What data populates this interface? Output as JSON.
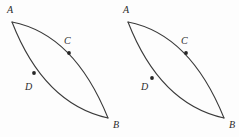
{
  "figure": {
    "type": "geometry-diagram",
    "background_color": "#fdfdfd",
    "stroke_color": "#3a3a3a",
    "label_color": "#2b2b2b",
    "dot_color": "#262626"
  },
  "shapes": [
    {
      "id": "left-figure",
      "name": "left-lens",
      "vertices": [
        {
          "label": "A",
          "x": 12,
          "y": 22,
          "label_x": 7,
          "label_y": 13
        },
        {
          "label": "B",
          "x": 108,
          "y": 118,
          "label_x": 113,
          "label_y": 128
        }
      ],
      "arcs": [
        {
          "id": "upper-arc",
          "name": "arc-A-C-B",
          "path": "M 12 22 Q 74 34 108 118",
          "marked_point": {
            "label": "C",
            "x": 69,
            "y": 53,
            "label_x": 64,
            "label_y": 44
          }
        },
        {
          "id": "lower-arc",
          "name": "arc-A-D-B",
          "path": "M 12 22 Q 44 104 108 118",
          "marked_point": {
            "label": "D",
            "x": 34,
            "y": 73,
            "label_x": 25,
            "label_y": 90
          }
        }
      ]
    },
    {
      "id": "right-figure",
      "name": "right-lens",
      "vertices": [
        {
          "label": "A",
          "x": 128,
          "y": 22,
          "label_x": 123,
          "label_y": 13
        },
        {
          "label": "B",
          "x": 224,
          "y": 118,
          "label_x": 229,
          "label_y": 128
        }
      ],
      "arcs": [
        {
          "id": "upper-arc",
          "name": "arc-A-C-B",
          "path": "M 128 22 Q 190 34 224 118",
          "marked_point": {
            "label": "C",
            "x": 186,
            "y": 53,
            "label_x": 181,
            "label_y": 44
          }
        },
        {
          "id": "lower-arc",
          "name": "arc-A-D-B",
          "path": "M 128 22 Q 160 104 224 118",
          "marked_point": {
            "label": "D",
            "x": 152,
            "y": 78,
            "label_x": 141,
            "label_y": 90
          }
        }
      ]
    }
  ]
}
